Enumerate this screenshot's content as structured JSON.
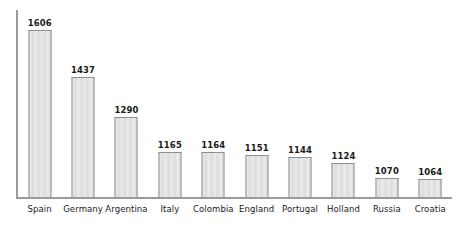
{
  "chart_data": {
    "type": "bar",
    "title": "",
    "subtitle": "",
    "xlabel": "",
    "ylabel": "",
    "categories": [
      "Spain",
      "Germany",
      "Argentina",
      "Italy",
      "Colombia",
      "England",
      "Portugal",
      "Holland",
      "Russia",
      "Croatia"
    ],
    "values": [
      1606,
      1437,
      1290,
      1165,
      1164,
      1151,
      1144,
      1124,
      1070,
      1064
    ],
    "value_labels": [
      "1606",
      "1437",
      "1290",
      "1165",
      "1164",
      "1151",
      "1144",
      "1124",
      "1070",
      "1064"
    ],
    "ylim": [
      1000,
      1680
    ],
    "grid": false,
    "legend": null,
    "axis_ticks": false,
    "tick_labels": [],
    "data_labels_shown": true,
    "colors": {
      "bar_fill": "#dedede",
      "bar_border": "#8f8f8f",
      "axis": "#9a9a9a",
      "text": "#1a1a1a",
      "background": "#ffffff"
    }
  }
}
